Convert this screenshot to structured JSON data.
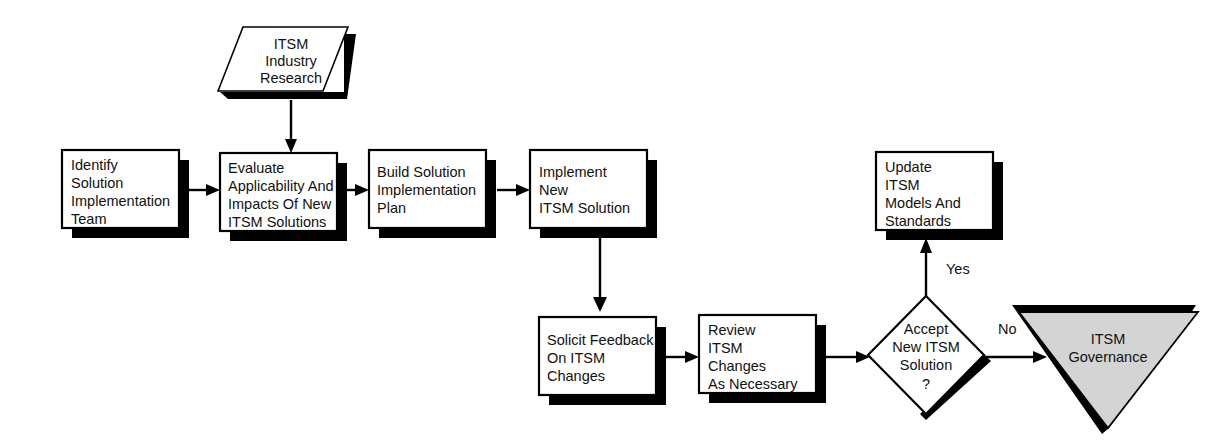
{
  "diagram": {
    "background_color": "#ffffff",
    "line_color": "#000000",
    "shadow_color": "#000000",
    "terminator_fill": "#d4d4d4",
    "nodes": {
      "input_research": {
        "shape": "parallelogram-input",
        "lines": [
          "ITSM",
          "Industry",
          "Research"
        ]
      },
      "identify_team": {
        "shape": "process",
        "lines": [
          "Identify",
          "Solution",
          "Implementation",
          "Team"
        ]
      },
      "evaluate": {
        "shape": "process",
        "lines": [
          "Evaluate",
          "Applicability  And",
          "Impacts Of  New",
          "ITSM Solutions"
        ]
      },
      "build_plan": {
        "shape": "process",
        "lines": [
          "Build Solution",
          "Implementation",
          "Plan"
        ]
      },
      "implement": {
        "shape": "process",
        "lines": [
          "Implement",
          "New",
          "ITSM Solution"
        ]
      },
      "update_models": {
        "shape": "process",
        "lines": [
          "Update",
          "ITSM",
          "Models And",
          "Standards"
        ]
      },
      "solicit_feedback": {
        "shape": "process",
        "lines": [
          "Solicit Feedback",
          "On ITSM",
          "Changes"
        ]
      },
      "review_changes": {
        "shape": "process",
        "lines": [
          "Review",
          "ITSM",
          "Changes",
          "As Necessary"
        ]
      },
      "accept_decision": {
        "shape": "decision",
        "lines": [
          "Accept",
          "New ITSM",
          "Solution",
          "?"
        ]
      },
      "itsm_governance": {
        "shape": "terminator-triangle",
        "lines": [
          "ITSM",
          "Governance"
        ]
      }
    },
    "edge_labels": {
      "yes": "Yes",
      "no": "No"
    }
  }
}
